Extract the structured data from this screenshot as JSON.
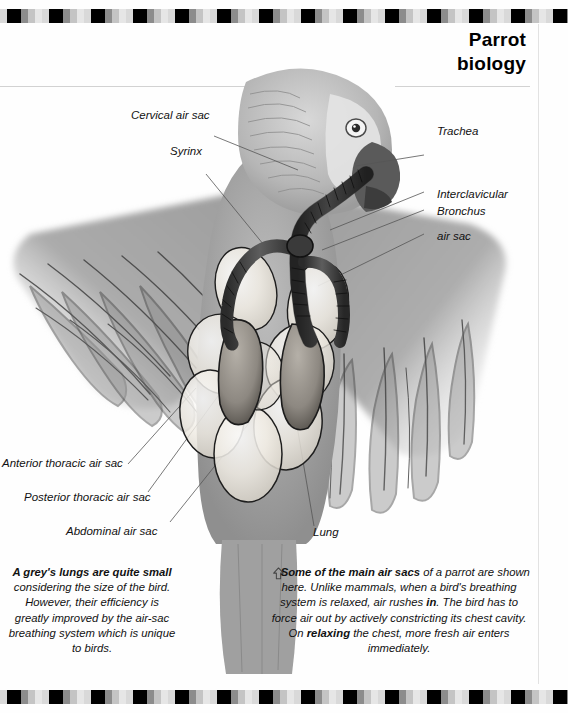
{
  "page": {
    "title_line1": "Parrot",
    "title_line2": "biology",
    "background_color": "#fefefe",
    "border_colors": [
      "#000000",
      "#8c8c8c",
      "#c4c4c4",
      "#d9d9d9",
      "#e6e6e6"
    ],
    "rule_color": "#d2d2d2"
  },
  "illustration": {
    "subject": "African grey parrot with respiratory system air sacs",
    "style": "pencil-sketch greyscale",
    "ink_color": "#1c1c1c",
    "sac_fill": "#f2efe9",
    "body_grey": "#9a9a9a"
  },
  "labels": {
    "cervical_air_sac": "Cervical air sac",
    "syrinx": "Syrinx",
    "trachea": "Trachea",
    "interclavicular_air_sac_l1": "Interclavicular",
    "interclavicular_air_sac_l2": "air sac",
    "bronchus": "Bronchus",
    "anterior_thoracic_air_sac": "Anterior thoracic air sac",
    "posterior_thoracic_air_sac": "Posterior thoracic air sac",
    "abdominal_air_sac": "Abdominal air sac",
    "lung": "Lung"
  },
  "captions": {
    "left": {
      "lead": "A grey's lungs are quite small",
      "body": " considering the size of the bird. However, their efficiency is greatly improved by the air-sac breathing system which is unique to birds."
    },
    "right": {
      "icon": "arrow-up-icon",
      "lead": "Some of the main air sacs",
      "body_1": " of a parrot are shown here. Unlike mammals, when a bird's breathing system is relaxed, air rushes ",
      "emph_1": "in",
      "body_2": ". The bird has to force air out by actively constricting its chest cavity. On ",
      "emph_2": "relaxing",
      "body_3": " the chest, more fresh air enters immediately."
    }
  }
}
